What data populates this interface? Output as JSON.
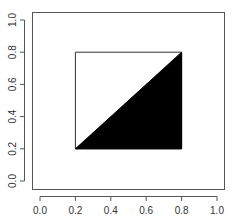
{
  "chart_data": {
    "type": "polygon",
    "title": "",
    "xlabel": "",
    "ylabel": "",
    "xlim": [
      0,
      1
    ],
    "ylim": [
      0,
      1
    ],
    "grid": false,
    "legend": null,
    "x_ticks": [
      "0.0",
      "0.2",
      "0.4",
      "0.6",
      "0.8",
      "1.0"
    ],
    "y_ticks": [
      "0.0",
      "0.2",
      "0.4",
      "0.6",
      "0.8",
      "1.0"
    ],
    "shapes": [
      {
        "name": "outline-square",
        "points": [
          [
            0.2,
            0.2
          ],
          [
            0.8,
            0.2
          ],
          [
            0.8,
            0.8
          ],
          [
            0.2,
            0.8
          ]
        ],
        "fill": "#ffffff",
        "stroke": "#000000"
      },
      {
        "name": "filled-triangle",
        "points": [
          [
            0.2,
            0.2
          ],
          [
            0.8,
            0.2
          ],
          [
            0.8,
            0.8
          ]
        ],
        "fill": "#000000",
        "stroke": "#000000"
      }
    ]
  },
  "plot": {
    "box": {
      "left": 32,
      "right": 224,
      "top": 12,
      "bottom": 189
    },
    "x_px": {
      "min": 40,
      "max": 217
    },
    "y_px": {
      "min": 181,
      "max": 20
    },
    "axis_color": "#555555",
    "shape_stroke": "#333333"
  }
}
